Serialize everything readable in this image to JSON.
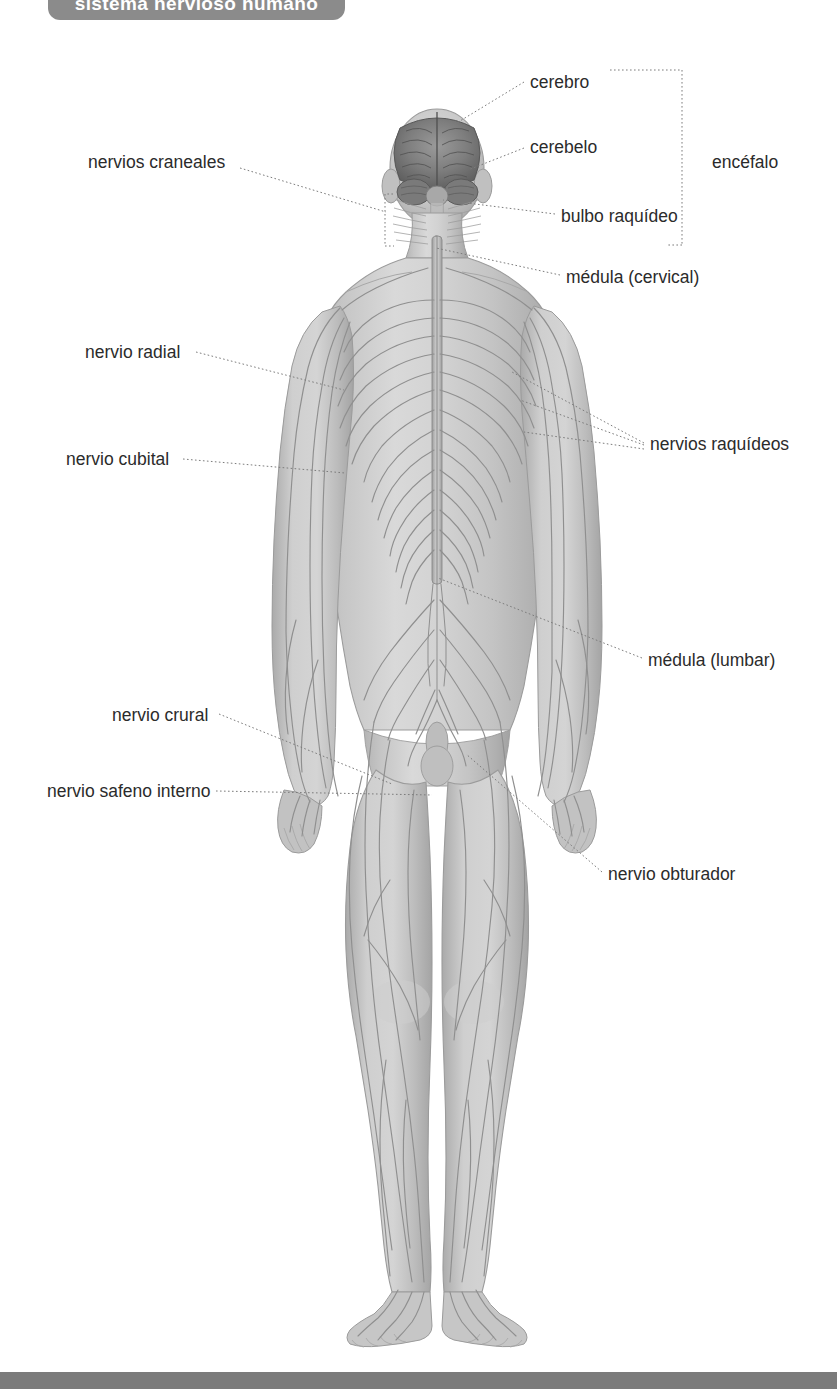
{
  "header": {
    "title": "sistema nervioso humano",
    "title_bg_color": "#8b8b8b",
    "title_text_color": "#ffffff"
  },
  "footer": {
    "bar_color": "#7b7b7b"
  },
  "figure": {
    "skin_color": "#c9c9c9",
    "nerve_color": "#8f8f8f",
    "brain_color": "#6e6e6e",
    "outline_color": "#8a8a8a"
  },
  "labels": [
    {
      "id": "cerebro",
      "text": "cerebro",
      "x": 530,
      "y": 85,
      "align": "left",
      "anchor_x": 455,
      "anchor_y": 124
    },
    {
      "id": "cerebelo",
      "text": "cerebelo",
      "x": 530,
      "y": 150,
      "align": "left",
      "anchor_x": 468,
      "anchor_y": 170
    },
    {
      "id": "bulbo-raquideo",
      "text": "bulbo raquídeo",
      "x": 561,
      "y": 219,
      "align": "left",
      "anchor_x": 437,
      "anchor_y": 203
    },
    {
      "id": "medula-cervical",
      "text": "médula (cervical)",
      "x": 566,
      "y": 280,
      "align": "left",
      "anchor_x": 434,
      "anchor_y": 248
    },
    {
      "id": "encefalo",
      "text": "encéfalo",
      "x": 712,
      "y": 165,
      "align": "left",
      "anchor_x": null,
      "anchor_y": null
    },
    {
      "id": "nervios-craneales",
      "text": "nervios craneales",
      "x": 88,
      "y": 165,
      "align": "left",
      "anchor_x": 385,
      "anchor_y": 210
    },
    {
      "id": "nervio-radial",
      "text": "nervio radial",
      "x": 85,
      "y": 355,
      "align": "left",
      "anchor_x": 307,
      "anchor_y": 392
    },
    {
      "id": "nervio-cubital",
      "text": "nervio cubital",
      "x": 66,
      "y": 462,
      "align": "left",
      "anchor_x": 330,
      "anchor_y": 472
    },
    {
      "id": "nervios-raquideos",
      "text": "nervios raquídeos",
      "x": 650,
      "y": 447,
      "align": "left",
      "anchor_x": 520,
      "anchor_y": 385
    },
    {
      "id": "medula-lumbar",
      "text": "médula (lumbar)",
      "x": 648,
      "y": 663,
      "align": "left",
      "anchor_x": 437,
      "anchor_y": 578
    },
    {
      "id": "nervio-crural",
      "text": "nervio crural",
      "x": 112,
      "y": 718,
      "align": "left",
      "anchor_x": 390,
      "anchor_y": 786
    },
    {
      "id": "nervio-safeno",
      "text": "nervio safeno interno",
      "x": 47,
      "y": 794,
      "align": "left",
      "anchor_x": 432,
      "anchor_y": 797
    },
    {
      "id": "nervio-obturador",
      "text": "nervio obturador",
      "x": 608,
      "y": 877,
      "align": "left",
      "anchor_x": 466,
      "anchor_y": 755
    }
  ],
  "brackets": [
    {
      "id": "encefalo-bracket",
      "x": 682,
      "y_top": 70,
      "y_bottom": 245,
      "tick_length": 10
    },
    {
      "id": "nervios-craneales-bracket",
      "x": 385,
      "y_top": 194,
      "y_bottom": 246,
      "tick_length": 8
    }
  ]
}
